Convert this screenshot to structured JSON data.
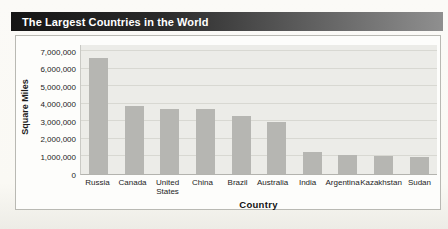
{
  "header": {
    "title": "The Largest Countries in the World",
    "bar_gradient_left": "#151515",
    "bar_gradient_right": "#8f8f8f",
    "text_color": "#ffffff"
  },
  "chart_data": {
    "type": "bar",
    "title": "The Largest Countries in the World",
    "xlabel": "Country",
    "ylabel": "Square Miles",
    "categories": [
      "Russia",
      "Canada",
      "United States",
      "China",
      "Brazil",
      "Australia",
      "India",
      "Argentina",
      "Kazakhstan",
      "Sudan"
    ],
    "values": [
      6600000,
      3850000,
      3720000,
      3700000,
      3290000,
      2970000,
      1270000,
      1070000,
      1050000,
      970000
    ],
    "ylim": [
      0,
      7000000
    ],
    "ytick_interval": 1000000,
    "ytick_labels": [
      "0",
      "1,000,000",
      "2,000,000",
      "3,000,000",
      "4,000,000",
      "5,000,000",
      "6,000,000",
      "7,000,000"
    ],
    "grid": true,
    "legend": "none",
    "bar_color": "#b6b6b2",
    "plot_background": "#ecece8",
    "gridline_color": "#d8d8d2"
  }
}
